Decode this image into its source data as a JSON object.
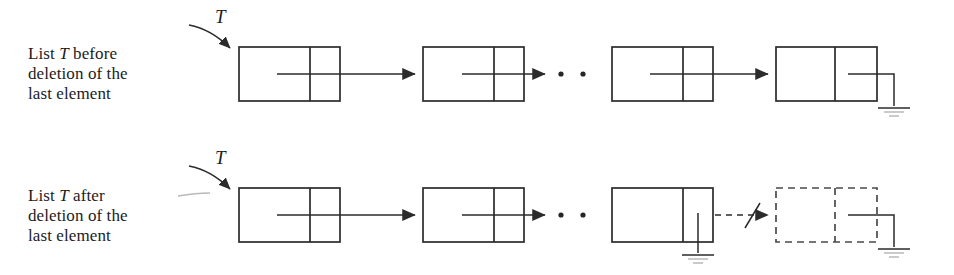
{
  "figure": {
    "type": "diagram",
    "ink_color": "#2b2b2b",
    "dashed_color": "#4a4a4a",
    "background": "#ffffff"
  },
  "rows": [
    {
      "id": "before",
      "caption_lines": [
        "List T before",
        "deletion of the",
        "last element"
      ],
      "caption_text": "List T before deletion of the last element",
      "pointer_label": "T",
      "ellipsis": "· ·",
      "nodes": [
        {
          "index": 0,
          "style": "solid",
          "data": "",
          "next": "arrow"
        },
        {
          "index": 1,
          "style": "solid",
          "data": "",
          "next": "arrow"
        },
        {
          "index": 2,
          "style": "solid",
          "data": "",
          "next": "arrow"
        },
        {
          "index": 3,
          "style": "solid",
          "data": "",
          "next": "ground"
        }
      ],
      "link_broken": false
    },
    {
      "id": "after",
      "caption_lines": [
        "List T after",
        "deletion of the",
        "last element"
      ],
      "caption_text": "List T after deletion of the last element",
      "pointer_label": "T",
      "ellipsis": "· ·",
      "nodes": [
        {
          "index": 0,
          "style": "solid",
          "data": "",
          "next": "arrow"
        },
        {
          "index": 1,
          "style": "solid",
          "data": "",
          "next": "arrow"
        },
        {
          "index": 2,
          "style": "solid",
          "data": "",
          "next": "ground"
        },
        {
          "index": 3,
          "style": "dashed",
          "data": "",
          "next": "ground"
        }
      ],
      "link_broken": true,
      "broken_link_marker": "slash"
    }
  ],
  "symbols": {
    "ground": "nil-ground-symbol",
    "arrow": "next-pointer-arrow",
    "broken": "severed-link-slash",
    "ellipsis": "continuation-dots"
  }
}
